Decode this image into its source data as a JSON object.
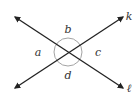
{
  "diagram": {
    "type": "intersecting-lines",
    "lines": [
      {
        "name": "k",
        "label": "k",
        "from": [
          15,
          88
        ],
        "to": [
          123,
          17
        ]
      },
      {
        "name": "l",
        "label": "ℓ",
        "from": [
          15,
          17
        ],
        "to": [
          123,
          88
        ]
      }
    ],
    "intersection": [
      68,
      52
    ],
    "angle_labels": [
      {
        "label": "a",
        "x": 38,
        "y": 56
      },
      {
        "label": "b",
        "x": 68,
        "y": 32
      },
      {
        "label": "c",
        "x": 98,
        "y": 56
      },
      {
        "label": "d",
        "x": 68,
        "y": 79
      }
    ],
    "colors": {
      "line": "#222222",
      "circle": "#999999",
      "text": "#333333"
    }
  }
}
